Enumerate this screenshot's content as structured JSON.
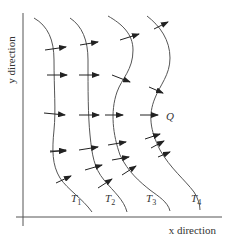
{
  "diagram": {
    "axes": {
      "x_label": "x direction",
      "y_label": "y direction"
    },
    "isotherms": [
      {
        "id": "T1",
        "letter": "T",
        "sub": "1"
      },
      {
        "id": "T2",
        "letter": "T",
        "sub": "2"
      },
      {
        "id": "T3",
        "letter": "T",
        "sub": "3"
      },
      {
        "id": "T4",
        "letter": "T",
        "sub": "4"
      }
    ],
    "flux_label": "Q",
    "colors": {
      "line": "#555555",
      "arrow": "#222222",
      "text": "#333333",
      "background": "#ffffff"
    }
  }
}
